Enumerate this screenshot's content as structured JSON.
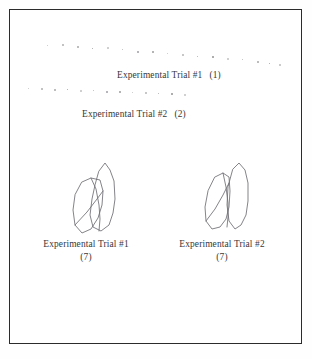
{
  "figure": {
    "background_color": "#fefefe",
    "frame_color": "#2b2b2b",
    "ink_color": "#37373a",
    "dot_color": "#8e8e93",
    "sketch_stroke_color": "#6e6e74"
  },
  "traces": [
    {
      "name": "trial-1-dot-trace",
      "points": [
        [
          46,
          44
        ],
        [
          61,
          43
        ],
        [
          76,
          45
        ],
        [
          91,
          47
        ],
        [
          106,
          46
        ],
        [
          121,
          48
        ],
        [
          136,
          50
        ],
        [
          151,
          50
        ],
        [
          166,
          52
        ],
        [
          181,
          53
        ],
        [
          196,
          55
        ],
        [
          211,
          55
        ],
        [
          226,
          57
        ],
        [
          241,
          58
        ],
        [
          256,
          60
        ],
        [
          268,
          62
        ],
        [
          278,
          63
        ]
      ]
    },
    {
      "name": "trial-2-dot-trace",
      "points": [
        [
          27,
          87
        ],
        [
          40,
          87
        ],
        [
          53,
          88
        ],
        [
          66,
          88
        ],
        [
          79,
          89
        ],
        [
          92,
          89
        ],
        [
          105,
          90
        ],
        [
          118,
          90
        ],
        [
          131,
          91
        ],
        [
          144,
          91
        ],
        [
          157,
          92
        ],
        [
          170,
          92
        ],
        [
          183,
          93
        ]
      ]
    }
  ],
  "labels": {
    "trial1_inline": {
      "text": "Experimental Trial #1",
      "number": "(1)"
    },
    "trial2_inline": {
      "text": "Experimental Trial #2",
      "number": "(2)"
    }
  },
  "captions": {
    "left": {
      "line1": "Experimental Trial #1",
      "line2": "(7)"
    },
    "right": {
      "line1": "Experimental Trial #2",
      "line2": "(7)"
    }
  },
  "sketches": {
    "left": {
      "name": "hand-drawn-figure-trial-1",
      "paths": [
        "M30 16 L36 8 L41 15 L45 26 L46 44 L44 58 L40 70 L32 76 L24 72 L21 60 L23 44 L26 30 Z",
        "M13 27 L22 23 L31 25 L34 36 L33 50 L29 63 L22 74 L13 78 L6 70 L4 55 L6 40 Z",
        "M22 23 L27 34 L30 50 L31 64 L30 76",
        "M6 70 L18 57 L28 44 L34 36"
      ]
    },
    "right": {
      "name": "hand-drawn-figure-trial-2",
      "paths": [
        "M32 10 L38 4 L44 11 L47 24 L47 42 L45 56 L40 66 L34 70 L28 62 L26 46 L27 28 Z",
        "M14 18 L22 14 L28 18 L29 32 L28 48 L25 60 L19 68 L11 70 L5 62 L4 48 L7 32 Z",
        "M22 14 L25 28 L27 44 L27 58 L26 68",
        "M5 62 L14 50 L22 36 L28 24"
      ]
    }
  }
}
